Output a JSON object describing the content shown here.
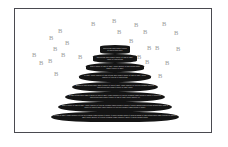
{
  "figure": {
    "name": "pyramid-diagram",
    "background_color": "#ffffff",
    "border_color": "#4a4a50",
    "tier_color": "#141414",
    "tier_text_color": "#d8d8d8",
    "marker_color": "#9b9b9b"
  },
  "pyramid": {
    "tiers": [
      {
        "index": 1,
        "x": 85,
        "y": 36,
        "width": 30,
        "height": 9,
        "text": "and actions while nam ut dolore sit and actions while"
      },
      {
        "index": 2,
        "x": 78,
        "y": 45,
        "width": 44,
        "height": 9,
        "text": "and actions while nam ut dolore sit and sit amet, conse sit and actions"
      },
      {
        "index": 3,
        "x": 71,
        "y": 54,
        "width": 58,
        "height": 9,
        "text": "nam ut dolore sit and sit amet, conse adipisic sit and actions while nam ut dolore sit amet"
      },
      {
        "index": 4,
        "x": 64,
        "y": 63,
        "width": 72,
        "height": 10,
        "text": "sit amet, conse adipisic sit and actions while nam ut dolore sit and sit amet, conse adipisic elit sed do sit and actions"
      },
      {
        "index": 5,
        "x": 57,
        "y": 73,
        "width": 86,
        "height": 10,
        "text": "adipisic sit and actions while nam ut dolore sit and sit amet, conse adipisic elit sed do eiusmod tempo sit and actions while nam ut dolore sit amet conse"
      },
      {
        "index": 6,
        "x": 50,
        "y": 83,
        "width": 100,
        "height": 10,
        "text": "sit and actions while nam ut dolore sit and sit amet, conse adipisic elit sed do eiusmod tempo incidid ut labore et dolore sit and actions while nam ut dolore sit and sit amet conse adipisic elit"
      },
      {
        "index": 7,
        "x": 43,
        "y": 93,
        "width": 114,
        "height": 10,
        "text": "nam ut dolore sit and sit amet, conse adipisic elit sed do eiusmod tempo incidid ut labore et dolore magna aliqua sit and actions while nam ut dolore sit and sit amet conse adipisic elit sed do eiusmod tempo incidid ut labore"
      },
      {
        "index": 8,
        "x": 36,
        "y": 103,
        "width": 128,
        "height": 10,
        "text": "sit and sit amet, conse adipisic elit sed do eiusmod tempo incidid ut labore et dolore magna aliqua ut enim ad minim sit and actions while nam ut dolore sit and sit amet conse adipisic elit sed do eiusmod tempo incidid ut labore et dolore magna aliqua"
      }
    ]
  },
  "markers": {
    "label": "B",
    "points": [
      {
        "x": 43,
        "y": 19
      },
      {
        "x": 76,
        "y": 12
      },
      {
        "x": 97,
        "y": 9
      },
      {
        "x": 119,
        "y": 13
      },
      {
        "x": 147,
        "y": 12
      },
      {
        "x": 34,
        "y": 26
      },
      {
        "x": 102,
        "y": 20
      },
      {
        "x": 128,
        "y": 20
      },
      {
        "x": 159,
        "y": 21
      },
      {
        "x": 50,
        "y": 31
      },
      {
        "x": 114,
        "y": 29
      },
      {
        "x": 38,
        "y": 37
      },
      {
        "x": 132,
        "y": 36
      },
      {
        "x": 140,
        "y": 36
      },
      {
        "x": 161,
        "y": 37
      },
      {
        "x": 17,
        "y": 43
      },
      {
        "x": 46,
        "y": 43
      },
      {
        "x": 63,
        "y": 45
      },
      {
        "x": 122,
        "y": 45
      },
      {
        "x": 24,
        "y": 51
      },
      {
        "x": 33,
        "y": 49
      },
      {
        "x": 130,
        "y": 50
      },
      {
        "x": 150,
        "y": 51
      },
      {
        "x": 39,
        "y": 62
      },
      {
        "x": 143,
        "y": 64
      }
    ]
  }
}
